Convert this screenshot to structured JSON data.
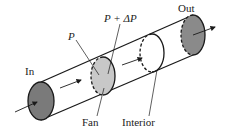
{
  "diagram": {
    "labels": {
      "in": "In",
      "out": "Out",
      "p": "P",
      "p_plus_dp": "P + ΔP",
      "fan": "Fan",
      "interior": "Interior"
    },
    "colors": {
      "inlet_fill": "#7a7a7a",
      "outlet_fill": "#8a8a8a",
      "fan_fill": "#c8c8c8",
      "line": "#1a1a1a"
    }
  }
}
